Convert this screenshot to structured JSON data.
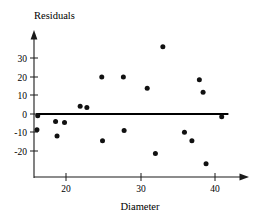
{
  "chart_data": {
    "type": "scatter",
    "title": "",
    "xlabel": "Diameter",
    "ylabel": "Residuals",
    "xlim": [
      15.5,
      43
    ],
    "ylim": [
      -30,
      40
    ],
    "xticks": [
      20,
      30,
      40
    ],
    "xtick_labels": [
      "20",
      "30",
      "40"
    ],
    "yticks": [
      -20,
      -10,
      0,
      10,
      20,
      30
    ],
    "ytick_labels": [
      "-20",
      "-10",
      "0",
      "10",
      "20",
      "30"
    ],
    "grid": false,
    "legend": null,
    "reference_line": {
      "name": "zero-residual-line",
      "orientation": "horizontal",
      "y": 0,
      "x_start": 16.0,
      "x_end": 41.8,
      "color": "#000000"
    },
    "points": [
      {
        "x": 16.2,
        "y": -1.0
      },
      {
        "x": 16.1,
        "y": -8.5
      },
      {
        "x": 18.6,
        "y": -4.0
      },
      {
        "x": 18.8,
        "y": -11.8
      },
      {
        "x": 19.8,
        "y": -4.6
      },
      {
        "x": 21.9,
        "y": 4.2
      },
      {
        "x": 22.8,
        "y": 3.5
      },
      {
        "x": 24.8,
        "y": 19.8
      },
      {
        "x": 24.9,
        "y": -14.3
      },
      {
        "x": 27.7,
        "y": 19.8
      },
      {
        "x": 27.8,
        "y": -8.8
      },
      {
        "x": 30.9,
        "y": 13.8
      },
      {
        "x": 32.0,
        "y": -21.2
      },
      {
        "x": 33.0,
        "y": 36.0
      },
      {
        "x": 35.9,
        "y": -9.8
      },
      {
        "x": 36.9,
        "y": -14.3
      },
      {
        "x": 37.9,
        "y": 18.4
      },
      {
        "x": 38.4,
        "y": 11.7
      },
      {
        "x": 38.8,
        "y": -26.6
      },
      {
        "x": 40.9,
        "y": -1.5
      }
    ],
    "marker": {
      "shape": "circle",
      "radius": 2.5,
      "color": "#111111"
    }
  },
  "axes": {
    "y_axis_name": "residuals-axis",
    "x_axis_name": "diameter-axis",
    "y_title": "Residuals",
    "x_title": "Diameter",
    "arrow_y_axis": true,
    "arrow_x_axis": true
  },
  "colors": {
    "background": "#ffffff",
    "axis": "#1a1a1a",
    "point": "#111111",
    "reference_line": "#000000"
  }
}
